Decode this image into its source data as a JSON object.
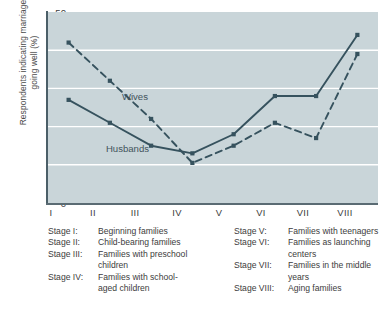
{
  "chart_data": {
    "type": "line",
    "title": "",
    "xlabel": "",
    "ylabel": "Respondents indicating marriage\ngoing well (%)",
    "ylim": [
      0,
      50
    ],
    "yticks": [
      0,
      10,
      20,
      30,
      40,
      50
    ],
    "grid": "horizontal",
    "legend_position": "inline-annotations",
    "categories": [
      "I",
      "II",
      "III",
      "IV",
      "V",
      "VI",
      "VII",
      "VIII"
    ],
    "series": [
      {
        "name": "Husbands",
        "style": "solid",
        "marker": "filled-square",
        "color": "#36525e",
        "values": [
          27,
          21,
          15,
          13,
          18,
          28,
          28,
          44
        ]
      },
      {
        "name": "Wives",
        "style": "dashed",
        "marker": "filled-square",
        "color": "#36525e",
        "values": [
          42,
          32,
          22,
          10.5,
          15,
          21,
          17,
          39
        ]
      }
    ],
    "annotations": [
      {
        "text": "Wives",
        "series": "Wives"
      },
      {
        "text": "Husbands",
        "series": "Husbands"
      }
    ],
    "plot_background": "#c9d5d9",
    "gridline_color": "#ffffff"
  },
  "axis": {
    "y_title": "Respondents indicating marriage\ngoing well (%)",
    "y_ticks": [
      "50",
      "40",
      "30",
      "20",
      "10",
      "0"
    ],
    "x_ticks": [
      "I",
      "II",
      "III",
      "IV",
      "V",
      "VI",
      "VII",
      "VIII"
    ]
  },
  "series_labels": {
    "wives": "Wives",
    "husbands": "Husbands"
  },
  "legend": {
    "left": [
      {
        "key": "Stage I:",
        "value": "Beginning families",
        "cont": ""
      },
      {
        "key": "Stage II:",
        "value": "Child-bearing families",
        "cont": ""
      },
      {
        "key": "Stage III:",
        "value": "Families with preschool",
        "cont": "children"
      },
      {
        "key": "Stage IV:",
        "value": "Families with school-",
        "cont": "aged children"
      }
    ],
    "right": [
      {
        "key": "Stage V:",
        "value": "Families with teenagers",
        "cont": ""
      },
      {
        "key": "Stage VI:",
        "value": "Families as launching",
        "cont": "centers"
      },
      {
        "key": "Stage VII:",
        "value": "Families in the middle",
        "cont": "years"
      },
      {
        "key": "Stage VIII:",
        "value": "Aging families",
        "cont": ""
      }
    ]
  }
}
